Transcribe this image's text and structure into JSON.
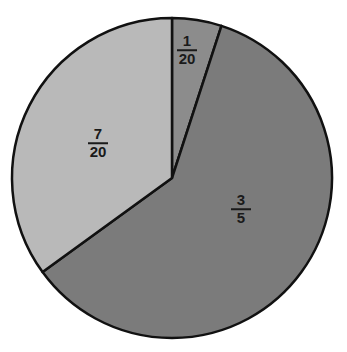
{
  "chart_data": {
    "type": "pie",
    "title": "",
    "start_angle_deg": 0,
    "direction": "clockwise",
    "slices": [
      {
        "label_num": "1",
        "label_den": "20",
        "value": 0.05,
        "color": "#8c8c8c"
      },
      {
        "label_num": "3",
        "label_den": "5",
        "value": 0.6,
        "color": "#7b7b7b"
      },
      {
        "label_num": "7",
        "label_den": "20",
        "value": 0.35,
        "color": "#b9b9b9"
      }
    ],
    "center": [
      172,
      178
    ],
    "radius": 160
  }
}
